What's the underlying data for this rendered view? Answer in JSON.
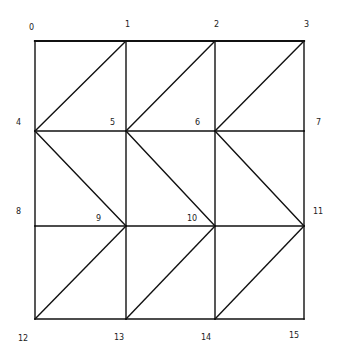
{
  "diagram": {
    "type": "triangulated-grid-mesh",
    "stroke_color": "#111111",
    "background": "#ffffff",
    "nodes": [
      {
        "id": "0",
        "x": 35,
        "y": 41,
        "lx": 29,
        "ly": 30
      },
      {
        "id": "1",
        "x": 126,
        "y": 41,
        "lx": 125,
        "ly": 27
      },
      {
        "id": "2",
        "x": 215,
        "y": 41,
        "lx": 214,
        "ly": 27
      },
      {
        "id": "3",
        "x": 304,
        "y": 41,
        "lx": 304,
        "ly": 27
      },
      {
        "id": "4",
        "x": 35,
        "y": 131,
        "lx": 16,
        "ly": 125
      },
      {
        "id": "5",
        "x": 126,
        "y": 131,
        "lx": 110,
        "ly": 125
      },
      {
        "id": "6",
        "x": 215,
        "y": 131,
        "lx": 195,
        "ly": 125
      },
      {
        "id": "7",
        "x": 304,
        "y": 131,
        "lx": 316,
        "ly": 125
      },
      {
        "id": "8",
        "x": 35,
        "y": 226,
        "lx": 16,
        "ly": 214
      },
      {
        "id": "9",
        "x": 126,
        "y": 226,
        "lx": 96,
        "ly": 221
      },
      {
        "id": "10",
        "x": 215,
        "y": 226,
        "lx": 187,
        "ly": 221
      },
      {
        "id": "11",
        "x": 304,
        "y": 226,
        "lx": 313,
        "ly": 214
      },
      {
        "id": "12",
        "x": 35,
        "y": 319,
        "lx": 18,
        "ly": 341
      },
      {
        "id": "13",
        "x": 126,
        "y": 319,
        "lx": 114,
        "ly": 340
      },
      {
        "id": "14",
        "x": 215,
        "y": 319,
        "lx": 201,
        "ly": 340
      },
      {
        "id": "15",
        "x": 304,
        "y": 319,
        "lx": 289,
        "ly": 338
      }
    ],
    "edges": [
      [
        "0",
        "1"
      ],
      [
        "1",
        "2"
      ],
      [
        "2",
        "3"
      ],
      [
        "4",
        "5"
      ],
      [
        "5",
        "6"
      ],
      [
        "6",
        "7"
      ],
      [
        "8",
        "9"
      ],
      [
        "9",
        "10"
      ],
      [
        "10",
        "11"
      ],
      [
        "12",
        "13"
      ],
      [
        "13",
        "14"
      ],
      [
        "14",
        "15"
      ],
      [
        "0",
        "4"
      ],
      [
        "4",
        "8"
      ],
      [
        "8",
        "12"
      ],
      [
        "1",
        "5"
      ],
      [
        "5",
        "9"
      ],
      [
        "9",
        "13"
      ],
      [
        "2",
        "6"
      ],
      [
        "6",
        "10"
      ],
      [
        "10",
        "14"
      ],
      [
        "3",
        "7"
      ],
      [
        "7",
        "11"
      ],
      [
        "11",
        "15"
      ],
      [
        "4",
        "1"
      ],
      [
        "5",
        "2"
      ],
      [
        "6",
        "3"
      ],
      [
        "4",
        "9"
      ],
      [
        "5",
        "10"
      ],
      [
        "6",
        "11"
      ],
      [
        "12",
        "9"
      ],
      [
        "13",
        "10"
      ],
      [
        "14",
        "11"
      ]
    ],
    "thick_edges": [
      [
        "0",
        "1"
      ],
      [
        "1",
        "2"
      ],
      [
        "2",
        "3"
      ]
    ]
  }
}
